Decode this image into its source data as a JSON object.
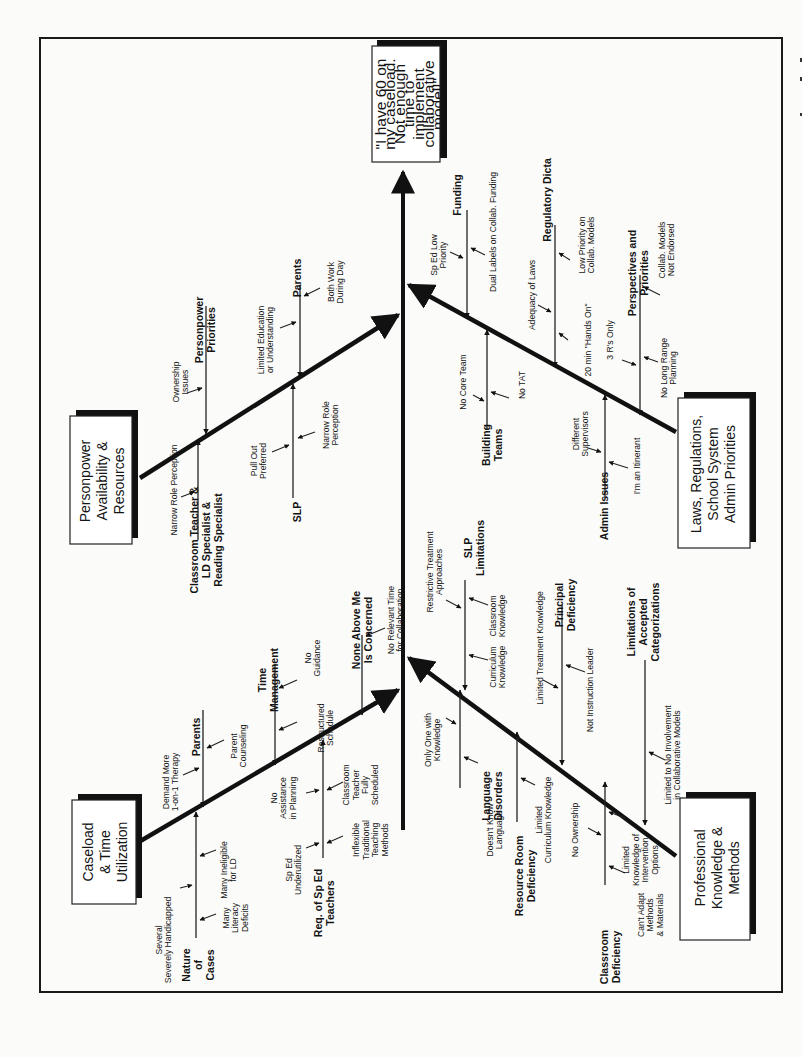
{
  "page": {
    "orientation": "rotated-90-ccw",
    "frame": {
      "x": 40,
      "y": 38,
      "w": 742,
      "h": 954
    }
  },
  "head": {
    "lines": [
      "\"I have 60 on",
      "my caseload.",
      "Not enough",
      "time to",
      "implement",
      "collaborative",
      "model!\""
    ]
  },
  "categories": [
    {
      "id": "personpower",
      "lines": [
        "Personpower",
        "Availability &",
        "Resources"
      ]
    },
    {
      "id": "laws",
      "lines": [
        "Laws, Regulations,",
        "School System",
        "Admin Priorities"
      ]
    },
    {
      "id": "caseload",
      "lines": [
        "Caseload",
        "& Time",
        "Utilization"
      ]
    },
    {
      "id": "professional",
      "lines": [
        "Professional",
        "Knowledge &",
        "Methods"
      ]
    }
  ],
  "sub_causes": {
    "personpower": [
      {
        "label": [
          "Personpower",
          "Priorities"
        ],
        "causes": [
          [
            "Ownership",
            "Issues"
          ]
        ]
      },
      {
        "label": [
          "Parents"
        ],
        "causes": [
          [
            "Limited Education",
            "or Understanding"
          ],
          [
            "Both Work",
            "During Day"
          ]
        ]
      },
      {
        "label": [
          "SLP"
        ],
        "causes": [
          [
            "Pull Out",
            "Preferred"
          ],
          [
            "Narrow Role",
            "Perception"
          ]
        ]
      },
      {
        "label": [
          "Classroom Teacher &",
          "LD Specialist &",
          "Reading Specialist"
        ],
        "causes": [
          [
            "Narrow Role Perception"
          ]
        ]
      }
    ],
    "laws": [
      {
        "label": [
          "Funding"
        ],
        "causes": [
          [
            "Sp Ed Low",
            "Priority"
          ],
          [
            "Dual Labels on Collab. Funding"
          ]
        ]
      },
      {
        "label": [
          "Regulatory Dicta"
        ],
        "causes": [
          [
            "Adequacy of Laws"
          ],
          [
            "Low Priority on",
            "Collab. Models"
          ],
          [
            "20 min \"Hands On\""
          ]
        ]
      },
      {
        "label": [
          "Perspectives and",
          "Priorities"
        ],
        "causes": [
          [
            "Collab. Models",
            "Not Endorsed"
          ],
          [
            "3 R's Only"
          ],
          [
            "No Long Range",
            "Planning"
          ]
        ]
      },
      {
        "label": [
          "Building",
          "Teams"
        ],
        "causes": [
          [
            "No Core Team"
          ],
          [
            "No TAT"
          ]
        ]
      },
      {
        "label": [
          "Admin Issues"
        ],
        "causes": [
          [
            "Different",
            "Supervisors"
          ],
          [
            "I'm an Itinerant"
          ]
        ]
      }
    ],
    "caseload": [
      {
        "label": [
          "Parents"
        ],
        "causes": [
          [
            "Demand More",
            "1-on-1 Therapy"
          ],
          [
            "Parent",
            "Counseling"
          ]
        ]
      },
      {
        "label": [
          "Time",
          "Management"
        ],
        "causes": [
          [
            "No",
            "Guidance"
          ],
          [
            "Restructured",
            "Schedule"
          ]
        ]
      },
      {
        "label": [
          "None Above Me",
          "Is Concerned"
        ],
        "causes": [
          [
            "No Relevant Time",
            "for Collaboration"
          ]
        ]
      },
      {
        "label": [
          "Nature",
          "of",
          "Cases"
        ],
        "causes": [
          [
            "Several",
            "Severely Handicapped"
          ],
          [
            "Many Ineligible",
            "for LD"
          ],
          [
            "Many",
            "Literacy",
            "Deficits"
          ]
        ]
      },
      {
        "label": [
          "Req. of Sp Ed",
          "Teachers"
        ],
        "causes": [
          [
            "No",
            "Assistance",
            "in Planning"
          ],
          [
            "Classroom",
            "Teacher",
            "Fully",
            "Scheduled"
          ],
          [
            "Sp Ed",
            "Underutilized"
          ],
          [
            "Inflexible",
            "Traditional",
            "Teaching",
            "Methods"
          ]
        ]
      }
    ],
    "professional": [
      {
        "label": [
          "SLP",
          "Limitations"
        ],
        "causes": [
          [
            "Restrictive Treatment",
            "Approaches"
          ],
          [
            "Classroom",
            "Knowledge"
          ],
          [
            "Curriculum",
            "Knowledge"
          ]
        ]
      },
      {
        "label": [
          "Principal",
          "Deficiency"
        ],
        "causes": [
          [
            "Limited Treatment Knowledge"
          ],
          [
            "Not Instruction Leader"
          ]
        ]
      },
      {
        "label": [
          "Limitations of",
          "Accepted",
          "Categorizations"
        ],
        "causes": [
          [
            "Limited to No Involvement",
            "in Collaborative Models"
          ]
        ]
      },
      {
        "label": [
          "Language",
          "Disorders"
        ],
        "causes": [
          [
            "Only One with",
            "Knowledge"
          ],
          [
            "Doesn't Know",
            "Language"
          ]
        ]
      },
      {
        "label": [
          "Resource Room",
          "Deficiency"
        ],
        "causes": [
          [
            "Limited",
            "Curriculum Knowledge"
          ]
        ]
      },
      {
        "label": [
          "Classroom",
          "Deficiency"
        ],
        "causes": [
          [
            "No Ownership"
          ],
          [
            "Limited",
            "Knowledge of",
            "Intervention",
            "Options"
          ],
          [
            "Can't Adapt",
            "Methods",
            "& Materials"
          ]
        ]
      }
    ]
  },
  "layout": {
    "head_box": {
      "x": 372,
      "y": 46,
      "w": 68,
      "h": 116,
      "cx": 411,
      "cy": 104
    },
    "category_boxes": {
      "personpower": {
        "x": 70,
        "y": 416,
        "w": 62,
        "h": 128,
        "cx": 101,
        "cy": 481
      },
      "laws": {
        "x": 678,
        "y": 398,
        "w": 72,
        "h": 150,
        "cx": 712,
        "cy": 474
      },
      "caseload": {
        "x": 72,
        "y": 800,
        "w": 64,
        "h": 104,
        "cx": 104,
        "cy": 852
      },
      "professional": {
        "x": 680,
        "y": 798,
        "w": 70,
        "h": 142,
        "cx": 716,
        "cy": 868
      }
    },
    "labels": [
      {
        "ref": "sub_causes.personpower.0.label",
        "x": 205,
        "y": 330,
        "cls": "t-sub"
      },
      {
        "ref": "sub_causes.personpower.0.causes.0",
        "x": 180,
        "y": 382,
        "cls": "t-cause"
      },
      {
        "ref": "sub_causes.personpower.1.label",
        "x": 297,
        "y": 278,
        "cls": "t-sub"
      },
      {
        "ref": "sub_causes.personpower.1.causes.0",
        "x": 265,
        "y": 340,
        "cls": "t-cause"
      },
      {
        "ref": "sub_causes.personpower.1.causes.1",
        "x": 335,
        "y": 282,
        "cls": "t-cause"
      },
      {
        "ref": "sub_causes.personpower.2.label",
        "x": 297,
        "y": 512,
        "cls": "t-sub"
      },
      {
        "ref": "sub_causes.personpower.2.causes.0",
        "x": 258,
        "y": 461,
        "cls": "t-cause"
      },
      {
        "ref": "sub_causes.personpower.2.causes.1",
        "x": 330,
        "y": 425,
        "cls": "t-cause"
      },
      {
        "ref": "sub_causes.personpower.3.label",
        "x": 206,
        "y": 540,
        "cls": "t-sub"
      },
      {
        "ref": "sub_causes.personpower.3.causes.0",
        "x": 174,
        "y": 490,
        "cls": "t-cause"
      },
      {
        "ref": "sub_causes.laws.0.label",
        "x": 457,
        "y": 195,
        "cls": "t-sub"
      },
      {
        "ref": "sub_causes.laws.0.causes.0",
        "x": 438,
        "y": 255,
        "cls": "t-cause"
      },
      {
        "ref": "sub_causes.laws.0.causes.1",
        "x": 493,
        "y": 232,
        "cls": "t-cause"
      },
      {
        "ref": "sub_causes.laws.1.label",
        "x": 547,
        "y": 200,
        "cls": "t-sub"
      },
      {
        "ref": "sub_causes.laws.1.causes.0",
        "x": 532,
        "y": 295,
        "cls": "t-cause"
      },
      {
        "ref": "sub_causes.laws.1.causes.1",
        "x": 586,
        "y": 245,
        "cls": "t-cause"
      },
      {
        "ref": "sub_causes.laws.1.causes.2",
        "x": 588,
        "y": 340,
        "cls": "t-cause"
      },
      {
        "ref": "sub_causes.laws.2.label",
        "x": 638,
        "y": 273,
        "cls": "t-sub"
      },
      {
        "ref": "sub_causes.laws.2.causes.0",
        "x": 666,
        "y": 250,
        "cls": "t-cause"
      },
      {
        "ref": "sub_causes.laws.2.causes.1",
        "x": 610,
        "y": 340,
        "cls": "t-cause"
      },
      {
        "ref": "sub_causes.laws.2.causes.2",
        "x": 668,
        "y": 368,
        "cls": "t-cause"
      },
      {
        "ref": "sub_causes.laws.3.label",
        "x": 492,
        "y": 445,
        "cls": "t-sub"
      },
      {
        "ref": "sub_causes.laws.3.causes.0",
        "x": 463,
        "y": 382,
        "cls": "t-cause"
      },
      {
        "ref": "sub_causes.laws.3.causes.1",
        "x": 522,
        "y": 385,
        "cls": "t-cause"
      },
      {
        "ref": "sub_causes.laws.4.label",
        "x": 604,
        "y": 506,
        "cls": "t-sub"
      },
      {
        "ref": "sub_causes.laws.4.causes.0",
        "x": 580,
        "y": 434,
        "cls": "t-cause"
      },
      {
        "ref": "sub_causes.laws.4.causes.1",
        "x": 637,
        "y": 466,
        "cls": "t-cause"
      },
      {
        "ref": "sub_causes.caseload.0.label",
        "x": 196,
        "y": 737,
        "cls": "t-sub"
      },
      {
        "ref": "sub_causes.caseload.0.causes.0",
        "x": 170,
        "y": 782,
        "cls": "t-cause"
      },
      {
        "ref": "sub_causes.caseload.0.causes.1",
        "x": 238,
        "y": 746,
        "cls": "t-cause"
      },
      {
        "ref": "sub_causes.caseload.1.label",
        "x": 268,
        "y": 680,
        "cls": "t-sub"
      },
      {
        "ref": "sub_causes.caseload.1.causes.0",
        "x": 312,
        "y": 658,
        "cls": "t-cause"
      },
      {
        "ref": "sub_causes.caseload.1.causes.1",
        "x": 325,
        "y": 728,
        "cls": "t-cause"
      },
      {
        "ref": "sub_causes.caseload.2.label",
        "x": 362,
        "y": 630,
        "cls": "t-sub"
      },
      {
        "ref": "sub_causes.caseload.2.causes.0",
        "x": 395,
        "y": 620,
        "cls": "t-cause"
      },
      {
        "ref": "sub_causes.caseload.3.label",
        "x": 198,
        "y": 965,
        "cls": "t-sub"
      },
      {
        "ref": "sub_causes.caseload.3.causes.0",
        "x": 163,
        "y": 940,
        "cls": "t-cause"
      },
      {
        "ref": "sub_causes.caseload.3.causes.1",
        "x": 228,
        "y": 870,
        "cls": "t-cause"
      },
      {
        "ref": "sub_causes.caseload.3.causes.2",
        "x": 235,
        "y": 918,
        "cls": "t-cause"
      },
      {
        "ref": "sub_causes.caseload.4.label",
        "x": 324,
        "y": 903,
        "cls": "t-sub"
      },
      {
        "ref": "sub_causes.caseload.4.causes.0",
        "x": 283,
        "y": 798,
        "cls": "t-cause"
      },
      {
        "ref": "sub_causes.caseload.4.causes.1",
        "x": 360,
        "y": 785,
        "cls": "t-cause"
      },
      {
        "ref": "sub_causes.caseload.4.causes.2",
        "x": 293,
        "y": 870,
        "cls": "t-cause"
      },
      {
        "ref": "sub_causes.caseload.4.causes.3",
        "x": 370,
        "y": 840,
        "cls": "t-cause"
      },
      {
        "ref": "sub_causes.professional.0.label",
        "x": 474,
        "y": 548,
        "cls": "t-sub"
      },
      {
        "ref": "sub_causes.professional.0.causes.0",
        "x": 434,
        "y": 572,
        "cls": "t-cause"
      },
      {
        "ref": "sub_causes.professional.0.causes.1",
        "x": 497,
        "y": 616,
        "cls": "t-cause"
      },
      {
        "ref": "sub_causes.professional.0.causes.2",
        "x": 497,
        "y": 667,
        "cls": "t-cause"
      },
      {
        "ref": "sub_causes.professional.1.label",
        "x": 565,
        "y": 605,
        "cls": "t-sub"
      },
      {
        "ref": "sub_causes.professional.1.causes.0",
        "x": 540,
        "y": 648,
        "cls": "t-cause"
      },
      {
        "ref": "sub_causes.professional.1.causes.1",
        "x": 590,
        "y": 690,
        "cls": "t-cause"
      },
      {
        "ref": "sub_causes.professional.2.label",
        "x": 643,
        "y": 622,
        "cls": "t-sub"
      },
      {
        "ref": "sub_causes.professional.2.causes.0",
        "x": 672,
        "y": 755,
        "cls": "t-cause"
      },
      {
        "ref": "sub_causes.professional.3.label",
        "x": 492,
        "y": 796,
        "cls": "t-sub"
      },
      {
        "ref": "sub_causes.professional.3.causes.0",
        "x": 432,
        "y": 740,
        "cls": "t-cause"
      },
      {
        "ref": "sub_causes.professional.3.causes.1",
        "x": 494,
        "y": 830,
        "cls": "t-cause"
      },
      {
        "ref": "sub_causes.professional.4.label",
        "x": 525,
        "y": 876,
        "cls": "t-sub"
      },
      {
        "ref": "sub_causes.professional.4.causes.0",
        "x": 543,
        "y": 820,
        "cls": "t-cause"
      },
      {
        "ref": "sub_causes.professional.4.causes.1",
        "x": 556,
        "y": 855,
        "cls": "t-cause"
      },
      {
        "ref": "sub_causes.professional.5.label",
        "x": 610,
        "y": 957,
        "cls": "t-sub"
      },
      {
        "ref": "sub_causes.professional.5.causes.0",
        "x": 575,
        "y": 830,
        "cls": "t-cause"
      },
      {
        "ref": "sub_causes.professional.5.causes.1",
        "x": 640,
        "y": 860,
        "cls": "t-cause"
      },
      {
        "ref": "sub_causes.professional.5.causes.2",
        "x": 650,
        "y": 915,
        "cls": "t-cause"
      }
    ]
  }
}
